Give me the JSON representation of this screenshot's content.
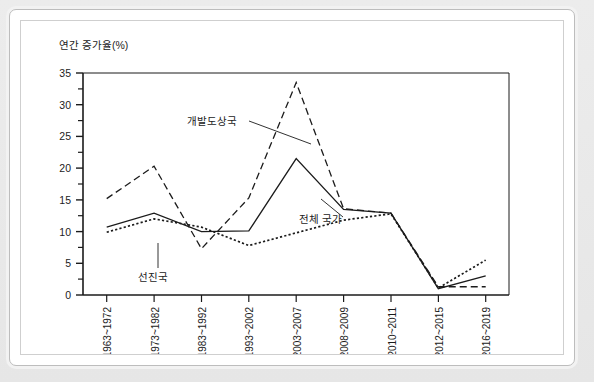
{
  "chart_data": {
    "type": "line",
    "title": "",
    "ylabel": "연간 증가율(%)",
    "xlabel": "",
    "ylim": [
      0,
      35
    ],
    "y_major_ticks": [
      0,
      5,
      10,
      15,
      20,
      25,
      30,
      35
    ],
    "y_minor_ticks": [
      2.5,
      7.5,
      12.5,
      17.5,
      22.5,
      27.5,
      32.5
    ],
    "grid": false,
    "legend_position": "inline-annotations",
    "categories": [
      "1963~1972",
      "1973~1982",
      "1983~1992",
      "1993~2002",
      "2003~2007",
      "2008~2009",
      "2010~2011",
      "2012~2015",
      "2016~2019"
    ],
    "series": [
      {
        "name": "개발도상국",
        "style": "dashed",
        "color": "#1b1b1b",
        "values": [
          15.2,
          20.3,
          7.3,
          15.3,
          33.5,
          13.6,
          12.9,
          1.3,
          1.3
        ]
      },
      {
        "name": "전체 국가",
        "style": "solid",
        "color": "#1b1b1b",
        "values": [
          10.7,
          12.9,
          10.0,
          10.1,
          21.5,
          13.5,
          12.9,
          1.0,
          3.0
        ]
      },
      {
        "name": "선진국",
        "style": "dotted",
        "color": "#1b1b1b",
        "values": [
          9.9,
          12.0,
          10.7,
          7.8,
          9.8,
          11.8,
          12.8,
          1.1,
          5.5
        ]
      }
    ],
    "annotations": [
      {
        "text": "개발도상국",
        "series": "개발도상국"
      },
      {
        "text": "전체 국가",
        "series": "전체 국가"
      },
      {
        "text": "선진국",
        "series": "선진국"
      }
    ]
  }
}
